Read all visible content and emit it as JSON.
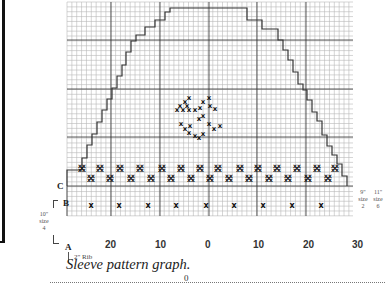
{
  "figure": {
    "caption": "Sleeve pattern graph.",
    "labels": {
      "C": "C",
      "B": "B",
      "A": "A",
      "rib": "2\" Rib",
      "left_size": [
        "10\"",
        "size",
        "4"
      ],
      "right_size_1": [
        "9\"",
        "size",
        "2"
      ],
      "right_size_2": [
        "11\"",
        "size",
        "6"
      ]
    },
    "x_axis_ticks": [
      "20",
      "10",
      "0",
      "10",
      "20",
      "30"
    ],
    "bottom_mark": "0"
  },
  "colors": {
    "grid_minor": "#b8b8b8",
    "grid_major": "#333333",
    "outline": "#333333",
    "stitch": "#111111"
  }
}
